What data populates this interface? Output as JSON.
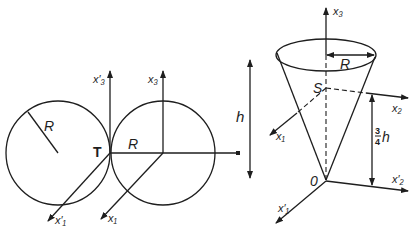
{
  "figure": {
    "left_panel": {
      "description": "Two tangent circles of radius R touching at point T with coordinate axes",
      "labels": {
        "radius_left": "R",
        "radius_right": "R",
        "tangent_point": "T",
        "axis_x3_prime": "x′₃",
        "axis_x3": "x₃",
        "axis_x1_prime": "x′₁",
        "axis_x1": "x₁"
      }
    },
    "right_panel": {
      "description": "Inverted cone of height h and base radius R with centroid S at 3/4 h",
      "labels": {
        "height": "h",
        "radius": "R",
        "centroid": "S",
        "origin": "0",
        "axis_x3": "x₃",
        "axis_x2": "x₂",
        "axis_x1": "x₁",
        "axis_x2_prime": "x′₂",
        "axis_x1_prime": "x′₁",
        "centroid_height_num": "3",
        "centroid_height_den": "4",
        "centroid_height_var": "h"
      }
    },
    "colors": {
      "ink": "#1e1e1e",
      "background": "#ffffff"
    }
  }
}
